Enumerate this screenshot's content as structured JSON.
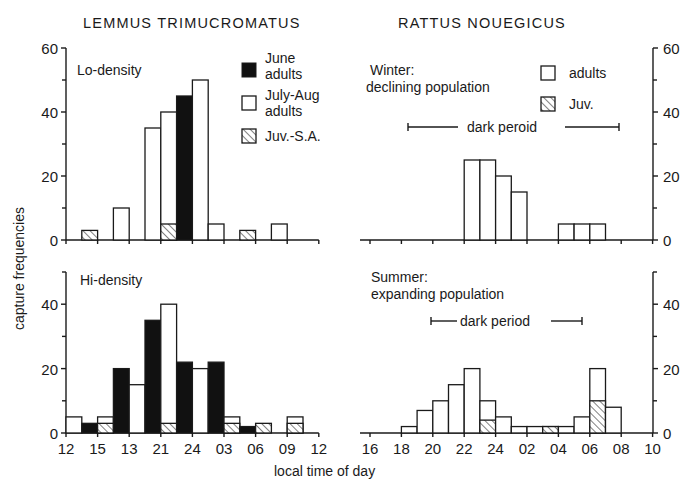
{
  "chart_data": [
    {
      "id": "lemmus-lo",
      "type": "bar",
      "species": "LEMMUS TRIMUCROMATUS",
      "panel_label": "Lo-density",
      "xlabel": "local time of day",
      "ylabel": "capture frequencies",
      "ylim": [
        0,
        60
      ],
      "yticks": [
        0,
        20,
        40,
        60
      ],
      "xticks": [
        "12",
        "15",
        "18",
        "21",
        "24",
        "03",
        "06",
        "09",
        "12"
      ],
      "bin_hours": 1.5,
      "legend": [
        {
          "name": "June adults",
          "fill": "black"
        },
        {
          "name": "July-Aug adults",
          "fill": "white"
        },
        {
          "name": "Juv.-S.A.",
          "fill": "hatch"
        }
      ],
      "bins": [
        {
          "start": "13:30",
          "june_adults": 0,
          "julyaug_adults": 0,
          "juv": 3
        },
        {
          "start": "16:30",
          "june_adults": 0,
          "julyaug_adults": 10,
          "juv": 0
        },
        {
          "start": "19:30",
          "june_adults": 0,
          "julyaug_adults": 35,
          "juv": 0
        },
        {
          "start": "21:00",
          "june_adults": 0,
          "julyaug_adults": 40,
          "juv": 5
        },
        {
          "start": "22:30",
          "june_adults": 45,
          "julyaug_adults": 0,
          "juv": 0
        },
        {
          "start": "24:00",
          "june_adults": 0,
          "julyaug_adults": 50,
          "juv": 0
        },
        {
          "start": "01:30",
          "june_adults": 0,
          "julyaug_adults": 5,
          "juv": 0
        },
        {
          "start": "04:30",
          "june_adults": 0,
          "julyaug_adults": 0,
          "juv": 3
        },
        {
          "start": "07:30",
          "june_adults": 0,
          "julyaug_adults": 5,
          "juv": 0
        }
      ]
    },
    {
      "id": "lemmus-hi",
      "type": "bar",
      "species": "LEMMUS TRIMUCROMATUS",
      "panel_label": "Hi-density",
      "xlabel": "local time of day",
      "ylabel": "capture frequencies",
      "ylim": [
        0,
        50
      ],
      "yticks": [
        0,
        20,
        40
      ],
      "xticks": [
        "12",
        "15",
        "13",
        "21",
        "24",
        "03",
        "06",
        "09",
        "12"
      ],
      "bin_hours": 1.5,
      "bins": [
        {
          "start": "12:00",
          "june_adults": 0,
          "julyaug_adults": 5,
          "juv": 0
        },
        {
          "start": "13:30",
          "june_adults": 3,
          "julyaug_adults": 0,
          "juv": 0
        },
        {
          "start": "15:00",
          "june_adults": 0,
          "julyaug_adults": 5,
          "juv": 3
        },
        {
          "start": "16:30",
          "june_adults": 20,
          "julyaug_adults": 0,
          "juv": 0
        },
        {
          "start": "18:00",
          "june_adults": 0,
          "julyaug_adults": 15,
          "juv": 0
        },
        {
          "start": "19:30",
          "june_adults": 35,
          "julyaug_adults": 0,
          "juv": 0
        },
        {
          "start": "21:00",
          "june_adults": 0,
          "julyaug_adults": 40,
          "juv": 3
        },
        {
          "start": "22:30",
          "june_adults": 22,
          "julyaug_adults": 0,
          "juv": 0
        },
        {
          "start": "24:00",
          "june_adults": 0,
          "julyaug_adults": 20,
          "juv": 0
        },
        {
          "start": "01:30",
          "june_adults": 22,
          "julyaug_adults": 0,
          "juv": 0
        },
        {
          "start": "03:00",
          "june_adults": 0,
          "julyaug_adults": 5,
          "juv": 3
        },
        {
          "start": "04:30",
          "june_adults": 2,
          "julyaug_adults": 0,
          "juv": 0
        },
        {
          "start": "06:00",
          "june_adults": 0,
          "julyaug_adults": 0,
          "juv": 3
        },
        {
          "start": "09:00",
          "june_adults": 0,
          "julyaug_adults": 5,
          "juv": 3
        }
      ]
    },
    {
      "id": "rattus-winter",
      "type": "bar",
      "species": "RATTUS NOUEGICUS",
      "panel_label": "Winter: declining population",
      "annotation": "dark peroid",
      "xlabel": "local time of day",
      "ylim": [
        0,
        60
      ],
      "yticks": [
        0,
        20,
        40,
        60
      ],
      "xticks": [
        "16",
        "18",
        "20",
        "22",
        "24",
        "02",
        "04",
        "06",
        "08",
        "10"
      ],
      "bin_hours": 1,
      "legend": [
        {
          "name": "adults",
          "fill": "white"
        },
        {
          "name": "Juv.",
          "fill": "hatch"
        }
      ],
      "bins": [
        {
          "start": "22:00",
          "adults": 25,
          "juv": 0
        },
        {
          "start": "23:00",
          "adults": 25,
          "juv": 0
        },
        {
          "start": "24:00",
          "adults": 20,
          "juv": 0
        },
        {
          "start": "01:00",
          "adults": 15,
          "juv": 0
        },
        {
          "start": "04:00",
          "adults": 5,
          "juv": 0
        },
        {
          "start": "05:00",
          "adults": 5,
          "juv": 0
        },
        {
          "start": "06:00",
          "adults": 5,
          "juv": 0
        }
      ]
    },
    {
      "id": "rattus-summer",
      "type": "bar",
      "species": "RATTUS NOUEGICUS",
      "panel_label": "Summer: expanding population",
      "annotation": "dark period",
      "xlabel": "local time of day",
      "ylim": [
        0,
        50
      ],
      "yticks": [
        0,
        20,
        40
      ],
      "xticks": [
        "16",
        "18",
        "20",
        "22",
        "24",
        "02",
        "04",
        "06",
        "08",
        "10"
      ],
      "bin_hours": 1,
      "bins": [
        {
          "start": "18:00",
          "adults": 2,
          "juv": 0
        },
        {
          "start": "19:00",
          "adults": 7,
          "juv": 0
        },
        {
          "start": "20:00",
          "adults": 10,
          "juv": 0
        },
        {
          "start": "21:00",
          "adults": 15,
          "juv": 0
        },
        {
          "start": "22:00",
          "adults": 20,
          "juv": 0
        },
        {
          "start": "23:00",
          "adults": 10,
          "juv": 4
        },
        {
          "start": "24:00",
          "adults": 5,
          "juv": 0
        },
        {
          "start": "01:00",
          "adults": 2,
          "juv": 0
        },
        {
          "start": "02:00",
          "adults": 2,
          "juv": 0
        },
        {
          "start": "03:00",
          "adults": 2,
          "juv": 2
        },
        {
          "start": "04:00",
          "adults": 2,
          "juv": 0
        },
        {
          "start": "05:00",
          "adults": 5,
          "juv": 0
        },
        {
          "start": "06:00",
          "adults": 20,
          "juv": 10
        },
        {
          "start": "07:00",
          "adults": 8,
          "juv": 0
        }
      ]
    }
  ],
  "render": {
    "species_left": "LEMMUS TRIMUCROMATUS",
    "species_right": "RATTUS NOUEGICUS",
    "ylabel": "capture frequencies",
    "xlabel": "local time of day",
    "lo_label": "Lo-density",
    "hi_label": "Hi-density",
    "winter_label_1": "Winter:",
    "winter_label_2": "declining population",
    "summer_label_1": "Summer:",
    "summer_label_2": "expanding population",
    "dark_winter": "dark peroid",
    "dark_summer": "dark period",
    "legend_left": [
      [
        "June",
        "adults"
      ],
      [
        "July-Aug",
        "adults"
      ],
      [
        "Juv.-S.A."
      ]
    ],
    "legend_right": [
      "adults",
      "Juv."
    ],
    "panels": [
      {
        "ref": 0,
        "x0": 66,
        "y0": 240,
        "pxu": 3.2,
        "binw": 15.8,
        "top": 48,
        "side": "left",
        "bars": [
          [
            1,
            0,
            0,
            3
          ],
          [
            3,
            0,
            10,
            0
          ],
          [
            5,
            0,
            35,
            0
          ],
          [
            6,
            0,
            40,
            5
          ],
          [
            7,
            45,
            0,
            0
          ],
          [
            8,
            0,
            50,
            0
          ],
          [
            9,
            0,
            5,
            0
          ],
          [
            11,
            0,
            0,
            3
          ],
          [
            13,
            0,
            5,
            0
          ]
        ],
        "ticks": [
          0,
          20,
          40,
          60
        ],
        "minor": [
          10,
          30,
          50
        ],
        "xt": [
          "",
          "",
          "",
          "",
          "",
          "",
          "",
          "",
          ""
        ],
        "nx": 8
      },
      {
        "ref": 1,
        "x0": 66,
        "y0": 433,
        "pxu": 3.22,
        "binw": 15.8,
        "top": 272,
        "side": "left",
        "bars": [
          [
            0,
            0,
            5,
            0
          ],
          [
            1,
            3,
            0,
            0
          ],
          [
            2,
            0,
            5,
            3
          ],
          [
            3,
            20,
            0,
            0
          ],
          [
            4,
            0,
            15,
            0
          ],
          [
            5,
            35,
            0,
            0
          ],
          [
            6,
            0,
            40,
            3
          ],
          [
            7,
            22,
            0,
            0
          ],
          [
            8,
            0,
            20,
            0
          ],
          [
            9,
            22,
            0,
            0
          ],
          [
            10,
            0,
            5,
            3
          ],
          [
            11,
            2,
            0,
            0
          ],
          [
            12,
            0,
            0,
            3
          ],
          [
            14,
            0,
            5,
            3
          ]
        ],
        "ticks": [
          0,
          20,
          40
        ],
        "minor": [
          10,
          30,
          50
        ],
        "xt": [
          "12",
          "15",
          "13",
          "21",
          "24",
          "03",
          "06",
          "09",
          "12"
        ],
        "nx": 8
      },
      {
        "ref": 2,
        "x0": 370,
        "y0": 240,
        "pxu": 3.2,
        "binw": 15.7,
        "top": 48,
        "side": "right",
        "axisx": 653,
        "bars": [
          [
            6,
            0,
            25,
            0
          ],
          [
            7,
            0,
            25,
            0
          ],
          [
            8,
            0,
            20,
            0
          ],
          [
            9,
            0,
            15,
            0
          ],
          [
            12,
            0,
            5,
            0
          ],
          [
            13,
            0,
            5,
            0
          ],
          [
            14,
            0,
            5,
            0
          ]
        ],
        "ticks": [
          0,
          20,
          40,
          60
        ],
        "minor": [
          10,
          30,
          50
        ],
        "xt": [
          "",
          "",
          "",
          "",
          "",
          "",
          "",
          "",
          "",
          ""
        ],
        "nx": 9
      },
      {
        "ref": 3,
        "x0": 370,
        "y0": 433,
        "pxu": 3.22,
        "binw": 15.7,
        "top": 272,
        "side": "right",
        "axisx": 653,
        "bars": [
          [
            2,
            0,
            2,
            0
          ],
          [
            3,
            0,
            7,
            0
          ],
          [
            4,
            0,
            10,
            0
          ],
          [
            5,
            0,
            15,
            0
          ],
          [
            6,
            0,
            20,
            0
          ],
          [
            7,
            0,
            10,
            4
          ],
          [
            8,
            0,
            5,
            0
          ],
          [
            9,
            0,
            2,
            0
          ],
          [
            10,
            0,
            2,
            0
          ],
          [
            11,
            0,
            2,
            2
          ],
          [
            12,
            0,
            2,
            0
          ],
          [
            13,
            0,
            5,
            0
          ],
          [
            14,
            0,
            20,
            10
          ],
          [
            15,
            0,
            8,
            0
          ]
        ],
        "ticks": [
          0,
          20,
          40
        ],
        "minor": [
          10,
          30,
          50
        ],
        "xt": [
          "16",
          "18",
          "20",
          "22",
          "24",
          "02",
          "04",
          "06",
          "08",
          "10"
        ],
        "nx": 9
      }
    ]
  }
}
